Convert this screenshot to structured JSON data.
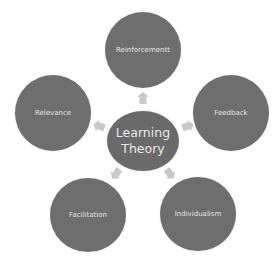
{
  "diagram": {
    "type": "radial-cycle",
    "center": {
      "label": "Learning Theory",
      "line1": "Learning",
      "line2": "Theory"
    },
    "nodes": [
      {
        "label": "Reinforcementt",
        "position": "top"
      },
      {
        "label": "Feedback",
        "position": "right"
      },
      {
        "label": "Individualism",
        "position": "bottom-right"
      },
      {
        "label": "Facilitation",
        "position": "bottom-left"
      },
      {
        "label": "Relevance",
        "position": "left"
      }
    ],
    "arrows": [
      {
        "from": "Learning Theory",
        "to": "Reinforcementt",
        "icon": "arrow-up-icon"
      },
      {
        "from": "Learning Theory",
        "to": "Feedback",
        "icon": "arrow-right-icon"
      },
      {
        "from": "Learning Theory",
        "to": "Individualism",
        "icon": "arrow-down-right-icon"
      },
      {
        "from": "Learning Theory",
        "to": "Facilitation",
        "icon": "arrow-down-left-icon"
      },
      {
        "from": "Learning Theory",
        "to": "Relevance",
        "icon": "arrow-left-icon"
      }
    ],
    "colors": {
      "node_fill": "#6e6e6e",
      "node_text": "#e4e4e4",
      "arrow_fill": "#c8c8c8",
      "background": "#ffffff"
    }
  }
}
